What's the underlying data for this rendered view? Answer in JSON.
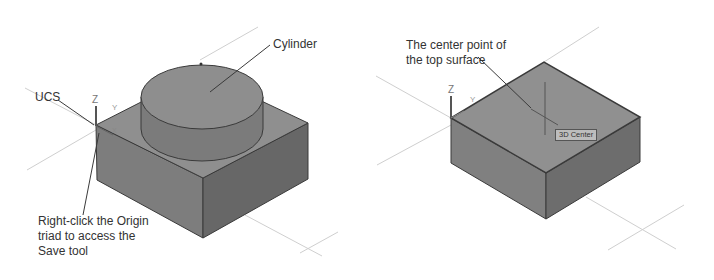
{
  "figure_left": {
    "callouts": {
      "cylinder": "Cylinder",
      "ucs": "UCS",
      "origin_note": "Right-click the Origin\ntriad to access the\nSave tool"
    },
    "axis": {
      "z": "Z",
      "y": "Y",
      "x": "X"
    }
  },
  "figure_right": {
    "callouts": {
      "center_point": "The center point of\nthe top surface"
    },
    "tooltip": "3D Center",
    "axis": {
      "z": "Z",
      "y": "Y"
    }
  },
  "colors": {
    "top_face": "#8f8f8f",
    "left_face": "#7d7d7d",
    "right_face": "#6a6a6a",
    "edge": "#3a3a3a",
    "grid_line": "#cfcfcf"
  }
}
